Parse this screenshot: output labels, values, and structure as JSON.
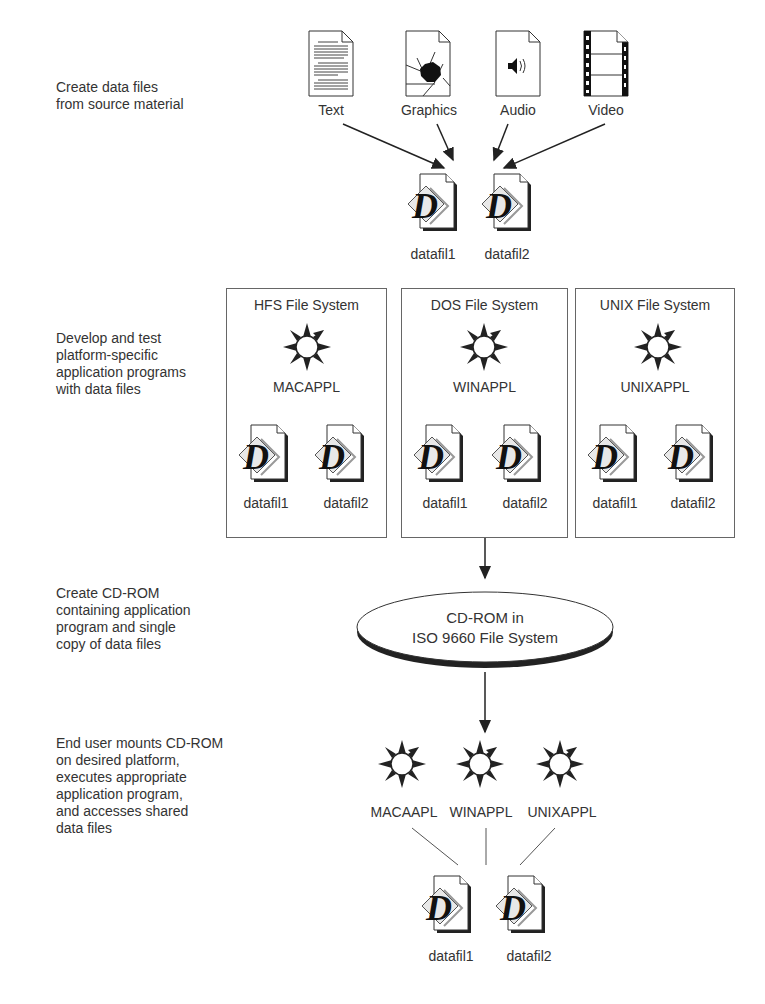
{
  "steps": [
    {
      "id": "create-data",
      "text": "Create data files\nfrom source material"
    },
    {
      "id": "develop-test",
      "text": "Develop and test\nplatform-specific\napplication programs\nwith data files"
    },
    {
      "id": "create-cdrom",
      "text": "Create CD-ROM\ncontaining application\nprogram and single\ncopy of data files"
    },
    {
      "id": "end-user",
      "text": "End user mounts CD-ROM\non desired platform,\nexecutes appropriate\napplication program,\nand accesses shared\ndata files"
    }
  ],
  "sources": [
    {
      "label": "Text",
      "icon": "text-document-icon"
    },
    {
      "label": "Graphics",
      "icon": "graphics-document-icon"
    },
    {
      "label": "Audio",
      "icon": "audio-document-icon"
    },
    {
      "label": "Video",
      "icon": "video-document-icon"
    }
  ],
  "data_files": [
    "datafil1",
    "datafil2"
  ],
  "file_systems": [
    {
      "title": "HFS File System",
      "app": "MACAPPL",
      "files": [
        "datafil1",
        "datafil2"
      ]
    },
    {
      "title": "DOS File System",
      "app": "WINAPPL",
      "files": [
        "datafil1",
        "datafil2"
      ]
    },
    {
      "title": "UNIX File System",
      "app": "UNIXAPPL",
      "files": [
        "datafil1",
        "datafil2"
      ]
    }
  ],
  "cdrom": {
    "line1": "CD-ROM in",
    "line2": "ISO 9660 File System"
  },
  "end_user_apps": [
    "MACAAPL",
    "WINAPPL",
    "UNIXAPPL"
  ],
  "shared_files": [
    "datafil1",
    "datafil2"
  ]
}
